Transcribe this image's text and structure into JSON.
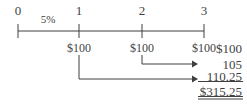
{
  "figure": {
    "background_color": "#ffffff",
    "ink_color": "#3f3f3f"
  },
  "timeline": {
    "axis_label": "time-axis",
    "periods": [
      {
        "label": "0",
        "x": 18
      },
      {
        "label": "1",
        "x": 79
      },
      {
        "label": "2",
        "x": 142
      },
      {
        "label": "3",
        "x": 204
      }
    ],
    "rate": {
      "label": "5%",
      "x": 48,
      "y": 14
    }
  },
  "cash_flows": [
    {
      "label": "$100",
      "x": 79
    },
    {
      "label": "$100",
      "x": 142
    },
    {
      "label": "$100",
      "x": 204
    }
  ],
  "arrows": [
    {
      "name": "compound-arrow-period-2",
      "from_x": 142,
      "to_x": 196,
      "y": 64,
      "drop_from_y": 55
    },
    {
      "name": "compound-arrow-period-1",
      "from_x": 79,
      "to_x": 196,
      "y": 79,
      "drop_from_y": 55
    }
  ],
  "sum_column": {
    "right_edge": 242,
    "items": [
      {
        "label": "$100",
        "y": 41,
        "rule": "none"
      },
      {
        "label": "105",
        "y": 58,
        "rule": "none"
      },
      {
        "label": "110.25",
        "y": 74,
        "rule": "single"
      },
      {
        "label": "$315.25",
        "y": 91,
        "rule": "double"
      }
    ],
    "total": "$315.25"
  }
}
